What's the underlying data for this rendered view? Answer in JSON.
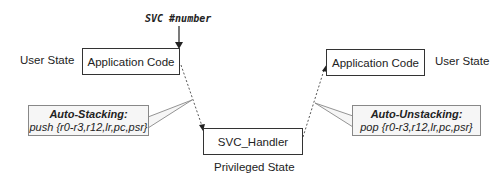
{
  "diagram": {
    "svc_instruction": "SVC #number",
    "left": {
      "state_label": "User State",
      "box_label": "Application Code"
    },
    "right": {
      "state_label": "User State",
      "box_label": "Application Code"
    },
    "handler": {
      "box_label": "SVC_Handler",
      "state_label": "Privileged State"
    },
    "callouts": {
      "stacking": {
        "title": "Auto-Stacking:",
        "body": "push {r0-r3,r12,lr,pc,psr}"
      },
      "unstacking": {
        "title": "Auto-Unstacking:",
        "body": "pop {r0-r3,r12,lr,pc,psr}"
      }
    }
  }
}
